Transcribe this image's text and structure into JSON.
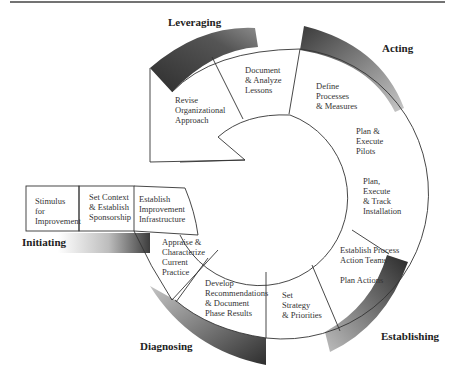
{
  "diagram": {
    "phases": {
      "leveraging": "Leveraging",
      "acting": "Acting",
      "establishing": "Establishing",
      "diagnosing": "Diagnosing",
      "initiating": "Initiating"
    },
    "steps": {
      "stimulus": [
        "Stimulus",
        "for",
        "Improvement"
      ],
      "set_context": [
        "Set Context",
        "& Establish",
        "Sponsorship"
      ],
      "establish_infrastructure": [
        "Establish",
        "Improvement",
        "Infrastructure"
      ],
      "appraise": [
        "Appraise &",
        "Characterize",
        "Current",
        "Practice"
      ],
      "develop_recommendations": [
        "Develop",
        "Recommendations",
        "& Document",
        "Phase Results"
      ],
      "set_strategy": [
        "Set",
        "Strategy",
        "& Priorities"
      ],
      "establish_teams": [
        "Establish Process",
        "Action Teams"
      ],
      "plan_actions": [
        "Plan Actions"
      ],
      "plan_execute_track": [
        "Plan,",
        "Execute",
        "& Track",
        "Installation"
      ],
      "plan_execute_pilots": [
        "Plan &",
        "Execute",
        "Pilots"
      ],
      "define_processes": [
        "Define",
        "Processes",
        "& Measures"
      ],
      "document_lessons": [
        "Document",
        "& Analyze",
        "Lessons"
      ],
      "revise_approach": [
        "Revise",
        "Organizational",
        "Approach"
      ]
    },
    "colors": {
      "band_dark": "#3a3a3a",
      "band_light": "#d8d8d8",
      "line": "#333333"
    }
  }
}
